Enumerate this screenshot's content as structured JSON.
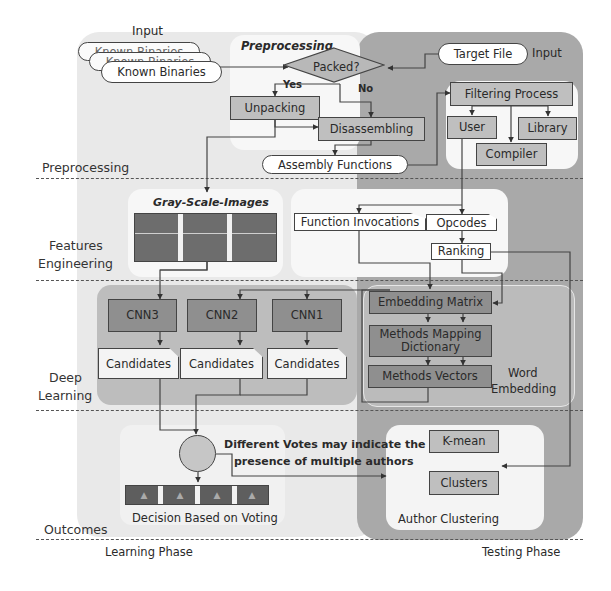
{
  "phases": {
    "learning": "Learning Phase",
    "testing": "Testing Phase"
  },
  "rows": [
    {
      "id": "preprocessing",
      "label": "Preprocessing"
    },
    {
      "id": "features",
      "label": "Features\nEngineering",
      "line1": "Features",
      "line2": "Engineering"
    },
    {
      "id": "deep",
      "label": "Deep\nLearning",
      "line1": "Deep",
      "line2": "Learning"
    },
    {
      "id": "outcomes",
      "label": "Outcomes"
    }
  ],
  "input": {
    "left_label": "Input",
    "right_label": "Input",
    "known_binaries": [
      "Known Binaries",
      "Known Binaries",
      "Known Binaries"
    ],
    "target_file": "Target File"
  },
  "preprocessing": {
    "title": "Preprocessing",
    "decision": "Packed?",
    "yes": "Yes",
    "no": "No",
    "unpacking": "Unpacking",
    "disassembling": "Disassembling",
    "assembly_functions": "Assembly Functions"
  },
  "filtering": {
    "title": "Filtering Process",
    "user": "User",
    "library": "Library",
    "compiler": "Compiler"
  },
  "features": {
    "gray_title": "Gray-Scale-Images",
    "function_invocations": "Function Invocations",
    "opcodes": "Opcodes",
    "ranking": "Ranking"
  },
  "deep_learning": {
    "cnns": [
      "CNN3",
      "CNN2",
      "CNN1"
    ],
    "candidates": [
      "Candidates",
      "Candidates",
      "Candidates"
    ]
  },
  "word_embedding": {
    "title_line1": "Word",
    "title_line2": "Embedding",
    "embedding_matrix": "Embedding Matrix",
    "mapping_line1": "Methods Mapping",
    "mapping_line2": "Dictionary",
    "methods_vectors": "Methods Vectors"
  },
  "outcomes": {
    "votes_note_line1": "Different Votes may indicate the",
    "votes_note_line2": "presence of multiple authors",
    "decision": "Decision Based on Voting",
    "kmean": "K-mean",
    "clusters": "Clusters",
    "author_clustering": "Author Clustering"
  },
  "colors": {
    "learning_bg": "#e9e9e9",
    "testing_bg": "#a9a9a9",
    "box_mid": "#bfbfbf",
    "box_dark": "#8f8f8f",
    "line": "#444444"
  }
}
